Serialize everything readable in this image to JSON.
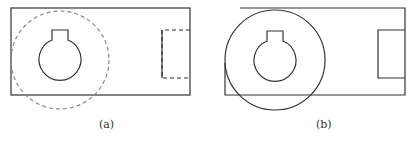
{
  "figure": {
    "panels": [
      {
        "label": "(a)",
        "rect": {
          "x": 11,
          "y": 8,
          "w": 179,
          "h": 87
        },
        "keyhole": {
          "cx": 60,
          "cy": 60,
          "r": 21,
          "slot_x1": 52,
          "slot_x2": 68,
          "slot_y": 30
        },
        "big_circle": {
          "cx": 60,
          "cy": 60,
          "r": 49,
          "style": "dashed"
        },
        "right_rect": {
          "x": 162,
          "y": 30,
          "w": 28,
          "h": 48,
          "style": "dashed"
        }
      },
      {
        "label": "(b)",
        "rect": {
          "x": 225,
          "y": 8,
          "w": 180,
          "h": 87
        },
        "keyhole": {
          "cx": 275,
          "cy": 62,
          "r": 21,
          "slot_x1": 267,
          "slot_x2": 283,
          "slot_y": 30
        },
        "big_circle": {
          "cx": 275,
          "cy": 60,
          "r": 50,
          "style": "solid"
        },
        "right_rect": {
          "x": 378,
          "y": 30,
          "w": 27,
          "h": 48,
          "style": "solid"
        }
      }
    ],
    "stroke_color": "#333333",
    "dashed_color": "#888888"
  }
}
